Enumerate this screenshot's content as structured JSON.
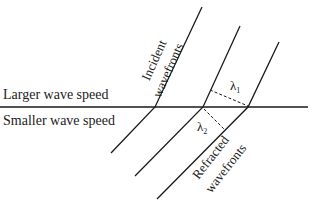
{
  "diagram": {
    "labels": {
      "upper_medium": "Larger wave speed",
      "lower_medium": "Smaller wave speed",
      "incident_line1": "Incident",
      "incident_line2": "wavefronts",
      "refracted_line1": "Refracted",
      "refracted_line2": "wavefronts",
      "lambda1": "λ",
      "lambda1_sub": "1",
      "lambda2": "λ",
      "lambda2_sub": "2"
    },
    "colors": {
      "line": "#1a1a1a",
      "background": "#ffffff"
    }
  }
}
